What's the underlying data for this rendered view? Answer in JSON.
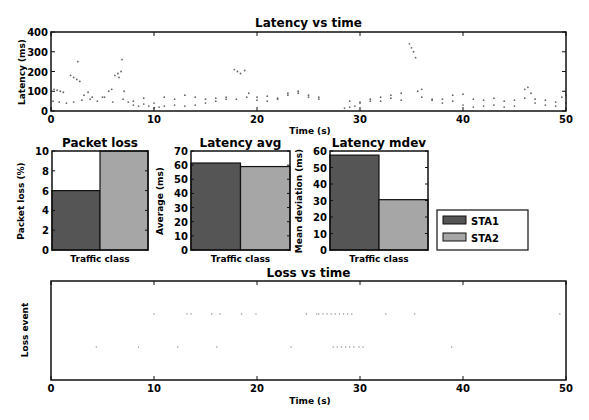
{
  "colors": {
    "STA1": "#555555",
    "STA2": "#a6a6a6",
    "axis": "#111111",
    "point": "#666666"
  },
  "chart_data": [
    {
      "id": "latency_vs_time",
      "type": "scatter",
      "title": "Latency vs time",
      "xlabel": "Time (s)",
      "ylabel": "Latency (ms)",
      "xlim": [
        0,
        50
      ],
      "ylim": [
        0,
        400
      ],
      "xticks": [
        "0",
        "10",
        "20",
        "30",
        "40",
        "50"
      ],
      "yticks": [
        "0",
        "100",
        "200",
        "300",
        "400"
      ],
      "grid": false,
      "series": [
        {
          "name": "STA1",
          "points": [
            [
              0.3,
              110
            ],
            [
              0.6,
              105
            ],
            [
              0.9,
              100
            ],
            [
              1.2,
              95
            ],
            [
              1.9,
              180
            ],
            [
              2.2,
              170
            ],
            [
              2.5,
              160
            ],
            [
              2.8,
              150
            ],
            [
              2.6,
              250
            ],
            [
              3.2,
              80
            ],
            [
              3.6,
              95
            ],
            [
              4.0,
              70
            ],
            [
              5.0,
              70
            ],
            [
              5.6,
              100
            ],
            [
              5.9,
              110
            ],
            [
              6.2,
              180
            ],
            [
              6.5,
              190
            ],
            [
              6.8,
              200
            ],
            [
              6.6,
              170
            ],
            [
              6.9,
              260
            ],
            [
              7.1,
              100
            ],
            [
              7.5,
              45
            ],
            [
              8.0,
              30
            ],
            [
              8.5,
              25
            ],
            [
              9.0,
              35
            ],
            [
              9.5,
              25
            ],
            [
              10.0,
              15
            ],
            [
              10.5,
              20
            ],
            [
              11.0,
              25
            ],
            [
              12.0,
              30
            ],
            [
              13.0,
              25
            ],
            [
              14.0,
              30
            ],
            [
              15.0,
              40
            ],
            [
              16.0,
              50
            ],
            [
              17.0,
              60
            ],
            [
              17.8,
              210
            ],
            [
              18.1,
              200
            ],
            [
              18.4,
              190
            ],
            [
              18.8,
              205
            ],
            [
              19.2,
              90
            ],
            [
              20.0,
              70
            ],
            [
              21.0,
              50
            ],
            [
              22.0,
              60
            ],
            [
              23.0,
              80
            ],
            [
              24.0,
              90
            ],
            [
              25.0,
              70
            ],
            [
              26.0,
              60
            ],
            [
              28.5,
              15
            ],
            [
              29.0,
              20
            ],
            [
              29.5,
              25
            ],
            [
              30.0,
              40
            ],
            [
              31.0,
              50
            ],
            [
              32.0,
              70
            ],
            [
              33.0,
              80
            ],
            [
              34.0,
              90
            ],
            [
              34.8,
              340
            ],
            [
              35.0,
              320
            ],
            [
              35.2,
              300
            ],
            [
              35.4,
              270
            ],
            [
              35.6,
              100
            ],
            [
              36.0,
              110
            ],
            [
              37.0,
              60
            ],
            [
              38.0,
              40
            ],
            [
              39.0,
              50
            ],
            [
              40.0,
              30
            ],
            [
              41.0,
              20
            ],
            [
              42.0,
              25
            ],
            [
              43.0,
              30
            ],
            [
              44.0,
              20
            ],
            [
              45.0,
              25
            ],
            [
              46.0,
              110
            ],
            [
              46.3,
              120
            ],
            [
              46.6,
              90
            ],
            [
              47.0,
              40
            ],
            [
              48.0,
              30
            ],
            [
              49.0,
              25
            ],
            [
              49.6,
              70
            ],
            [
              50.0,
              80
            ]
          ]
        },
        {
          "name": "STA2",
          "points": [
            [
              0.2,
              50
            ],
            [
              0.8,
              45
            ],
            [
              1.5,
              40
            ],
            [
              2.2,
              45
            ],
            [
              3.0,
              55
            ],
            [
              3.8,
              60
            ],
            [
              4.5,
              50
            ],
            [
              5.2,
              70
            ],
            [
              6.0,
              45
            ],
            [
              7.0,
              60
            ],
            [
              8.0,
              50
            ],
            [
              9.0,
              65
            ],
            [
              10.0,
              40
            ],
            [
              11.0,
              70
            ],
            [
              12.0,
              60
            ],
            [
              13.0,
              80
            ],
            [
              14.0,
              70
            ],
            [
              15.0,
              60
            ],
            [
              16.0,
              65
            ],
            [
              17.0,
              70
            ],
            [
              18.0,
              60
            ],
            [
              19.0,
              70
            ],
            [
              20.0,
              55
            ],
            [
              21.0,
              75
            ],
            [
              22.0,
              65
            ],
            [
              23.0,
              90
            ],
            [
              24.0,
              100
            ],
            [
              25.0,
              80
            ],
            [
              26.0,
              70
            ],
            [
              29.0,
              50
            ],
            [
              30.0,
              45
            ],
            [
              31.0,
              60
            ],
            [
              32.0,
              50
            ],
            [
              33.0,
              65
            ],
            [
              34.0,
              55
            ],
            [
              36.0,
              70
            ],
            [
              37.0,
              55
            ],
            [
              38.0,
              60
            ],
            [
              39.0,
              80
            ],
            [
              40.0,
              85
            ],
            [
              41.0,
              60
            ],
            [
              42.0,
              55
            ],
            [
              43.0,
              65
            ],
            [
              44.0,
              50
            ],
            [
              45.0,
              55
            ],
            [
              46.0,
              65
            ],
            [
              47.0,
              60
            ],
            [
              48.0,
              55
            ],
            [
              49.0,
              45
            ],
            [
              50.0,
              40
            ]
          ]
        }
      ]
    },
    {
      "id": "packet_loss",
      "type": "bar",
      "title": "Packet loss",
      "xlabel": "Traffic class",
      "ylabel": "Packet loss (%)",
      "ylim": [
        0,
        10
      ],
      "yticks": [
        "0",
        "2",
        "4",
        "6",
        "8",
        "10"
      ],
      "categories": [
        "STA1",
        "STA2"
      ],
      "values": [
        6,
        10
      ]
    },
    {
      "id": "latency_avg",
      "type": "bar",
      "title": "Latency avg",
      "xlabel": "Traffic class",
      "ylabel": "Average (ms)",
      "ylim": [
        0,
        70
      ],
      "yticks": [
        "0",
        "10",
        "20",
        "30",
        "40",
        "50",
        "60",
        "70"
      ],
      "categories": [
        "STA1",
        "STA2"
      ],
      "values": [
        61.5,
        59
      ]
    },
    {
      "id": "latency_mdev",
      "type": "bar",
      "title": "Latency mdev",
      "xlabel": "Traffic class",
      "ylabel": "Mean deviation (ms)",
      "ylim": [
        0,
        60
      ],
      "yticks": [
        "0",
        "10",
        "20",
        "30",
        "40",
        "50",
        "60"
      ],
      "categories": [
        "STA1",
        "STA2"
      ],
      "values": [
        57.5,
        30.5
      ],
      "legend": {
        "entries": [
          "STA1",
          "STA2"
        ],
        "position": "right"
      }
    },
    {
      "id": "loss_vs_time",
      "type": "scatter",
      "title": "Loss vs time",
      "xlabel": "Time (s)",
      "ylabel": "Loss event",
      "xlim": [
        0,
        50
      ],
      "xticks": [
        "0",
        "10",
        "20",
        "30",
        "40",
        "50"
      ],
      "grid": false,
      "series": [
        {
          "name": "STA2",
          "row": "upper",
          "times": [
            10.0,
            13.2,
            13.6,
            15.6,
            16.4,
            18.5,
            19.9,
            24.8,
            25.8,
            26.0,
            26.4,
            26.8,
            27.2,
            27.6,
            28.0,
            28.4,
            28.8,
            29.2,
            32.5,
            35.3,
            49.4
          ]
        },
        {
          "name": "STA1",
          "row": "lower",
          "times": [
            4.4,
            8.5,
            12.3,
            16.1,
            23.3,
            27.4,
            27.8,
            28.2,
            28.6,
            29.0,
            29.4,
            29.9,
            30.3,
            38.9
          ]
        }
      ]
    }
  ],
  "legend": {
    "items": [
      {
        "label": "STA1"
      },
      {
        "label": "STA2"
      }
    ]
  }
}
